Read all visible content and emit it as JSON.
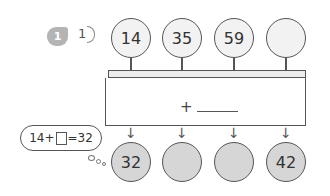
{
  "problem": {
    "number_badge": "1",
    "sub_label": "1"
  },
  "machine": {
    "inputs": [
      "14",
      "35",
      "59",
      ""
    ],
    "operation_symbol": "+",
    "operation_blank": "",
    "outputs": [
      "32",
      "",
      "",
      "42"
    ]
  },
  "hint_bubble": {
    "left": "14+",
    "right": "=32"
  },
  "colors": {
    "badge": "#b4b4b4",
    "input_fill": "#f2f2f2",
    "output_fill": "#d6d6d6",
    "stroke": "#555555"
  }
}
